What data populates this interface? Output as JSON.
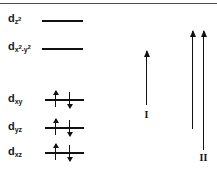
{
  "figure": {
    "background_color": "#ffffff",
    "line_color": "#111111",
    "rule_color": "#4d4d4d"
  },
  "orbitals": [
    {
      "id": "dz2",
      "label_base": "d",
      "label_sub": "z",
      "label_sup": "2",
      "occupancy": "empty",
      "electrons": []
    },
    {
      "id": "dx2y2",
      "label_base": "d",
      "label_sub": "x",
      "label_sup": "2",
      "label_sub2": "-y",
      "label_sup2": "2",
      "occupancy": "empty",
      "electrons": []
    },
    {
      "id": "dxy",
      "label_base": "d",
      "label_sub": "xy",
      "label_sup": "",
      "occupancy": "paired",
      "electrons": [
        "up",
        "down"
      ]
    },
    {
      "id": "dyz",
      "label_base": "d",
      "label_sub": "yz",
      "label_sup": "",
      "occupancy": "paired",
      "electrons": [
        "up",
        "down"
      ]
    },
    {
      "id": "dxz",
      "label_base": "d",
      "label_sub": "xz",
      "label_sup": "",
      "occupancy": "paired",
      "electrons": [
        "up",
        "down"
      ]
    }
  ],
  "transitions": [
    {
      "id": "I",
      "label": "I",
      "arrow_count": 1,
      "direction": "up"
    },
    {
      "id": "II",
      "label": "II",
      "arrow_count": 2,
      "direction": "up"
    }
  ]
}
